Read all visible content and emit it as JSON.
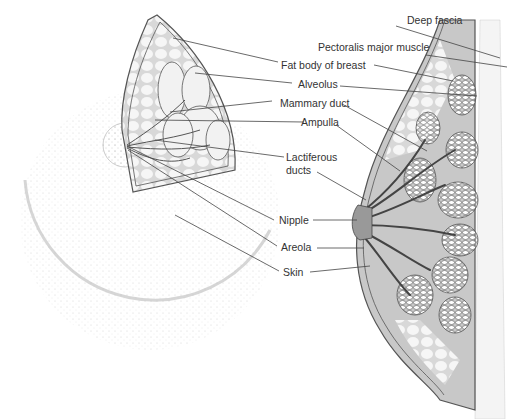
{
  "diagram": {
    "labels": {
      "deep_fascia": "Deep fascia",
      "pectoralis": "Pectoralis major muscle",
      "fat_body": "Fat body of breast",
      "alveolus": "Alveolus",
      "mammary_duct": "Mammary duct",
      "ampulla": "Ampulla",
      "lactiferous_1": "Lactiferous",
      "lactiferous_2": "ducts",
      "nipple": "Nipple",
      "areola": "Areola",
      "skin": "Skin"
    },
    "colors": {
      "line": "#444444",
      "tissue_gray": "#c8c8c8",
      "fat_light": "#efefef",
      "stipple": "#999999"
    }
  }
}
